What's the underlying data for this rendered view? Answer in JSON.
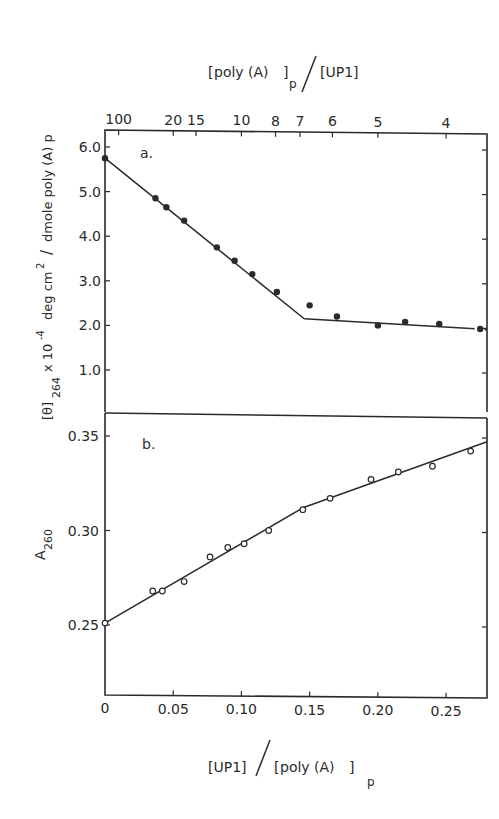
{
  "figure": {
    "top_axis_title": "[poly (A)]p / [UP1]",
    "bottom_axis_title": "[UP1] / [poly (A)]p",
    "top_axis_ticks": [
      "100",
      "20",
      "15",
      "10",
      "8",
      "7",
      "6",
      "5",
      "4"
    ],
    "bottom_axis_ticks": [
      "0",
      "0.05",
      "0.10",
      "0.15",
      "0.20",
      "0.25"
    ],
    "panel_a": {
      "label": "a.",
      "ylabel": "[θ]264 x 10^-4 deg cm^2 / dmole poly (A) p",
      "yticks": [
        "6.0",
        "5.0",
        "4.0",
        "3.0",
        "2.0",
        "1.0"
      ]
    },
    "panel_b": {
      "label": "b.",
      "ylabel": "A260",
      "yticks": [
        "0.35",
        "0.30",
        "0.25"
      ]
    }
  },
  "chart_data": [
    {
      "type": "scatter",
      "panel": "a.",
      "title": "",
      "xlabel": "[UP1]/[poly (A)]p (shared bottom axis); top axis: [poly (A)]p/[UP1]",
      "ylabel": "[θ]264 x 10^-4 deg cm^2/dmole poly (A) p",
      "xlim": [
        0,
        0.28
      ],
      "ylim": [
        0,
        6.3
      ],
      "top_xticks": {
        "labels": [
          "100",
          "20",
          "15",
          "10",
          "8",
          "7",
          "6",
          "5",
          "4"
        ],
        "positions": [
          0.01,
          0.05,
          0.0667,
          0.1,
          0.125,
          0.1429,
          0.1667,
          0.2,
          0.25
        ]
      },
      "yticks": [
        1.0,
        2.0,
        3.0,
        4.0,
        5.0,
        6.0
      ],
      "marker": "filled-circle",
      "series": [
        {
          "name": "data",
          "x": [
            0.0,
            0.037,
            0.045,
            0.058,
            0.082,
            0.095,
            0.108,
            0.126,
            0.15,
            0.17,
            0.2,
            0.22,
            0.245,
            0.275
          ],
          "y": [
            5.75,
            4.85,
            4.65,
            4.35,
            3.75,
            3.45,
            3.15,
            2.75,
            2.45,
            2.2,
            2.0,
            2.08,
            2.03,
            1.92
          ]
        }
      ],
      "fit_lines": [
        {
          "name": "fit-1",
          "x": [
            0.0,
            0.146
          ],
          "y": [
            5.75,
            2.15
          ],
          "style": "solid"
        },
        {
          "name": "fit-2",
          "x": [
            0.146,
            0.268
          ],
          "y": [
            2.15,
            1.93
          ],
          "style": "solid"
        },
        {
          "name": "fit-2-ext",
          "x": [
            0.268,
            0.28
          ],
          "y": [
            1.93,
            1.9
          ],
          "style": "dashed"
        }
      ]
    },
    {
      "type": "scatter",
      "panel": "b.",
      "title": "",
      "xlabel": "[UP1]/[poly (A)]p",
      "ylabel": "A260",
      "xlim": [
        0,
        0.28
      ],
      "ylim": [
        0.23,
        0.362
      ],
      "xticks": [
        0,
        0.05,
        0.1,
        0.15,
        0.2,
        0.25
      ],
      "yticks": [
        0.25,
        0.3,
        0.35
      ],
      "marker": "open-circle",
      "series": [
        {
          "name": "data",
          "x": [
            0.0,
            0.035,
            0.042,
            0.058,
            0.077,
            0.09,
            0.102,
            0.12,
            0.145,
            0.165,
            0.195,
            0.215,
            0.24,
            0.268
          ],
          "y": [
            0.251,
            0.268,
            0.268,
            0.273,
            0.286,
            0.291,
            0.293,
            0.3,
            0.311,
            0.317,
            0.327,
            0.331,
            0.334,
            0.342
          ]
        }
      ],
      "fit_lines": [
        {
          "name": "fit-1",
          "x": [
            0.0,
            0.145
          ],
          "y": [
            0.251,
            0.312
          ],
          "style": "solid"
        },
        {
          "name": "fit-2",
          "x": [
            0.145,
            0.28
          ],
          "y": [
            0.312,
            0.347
          ],
          "style": "solid"
        }
      ]
    }
  ]
}
